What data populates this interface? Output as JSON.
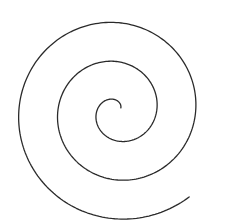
{
  "diagram": {
    "type": "archimedean-spiral",
    "background_color": "#ffffff",
    "stroke_color": "#2a2a2a",
    "stroke_width": 1.3,
    "center": [
      117,
      111
    ],
    "start_angle_deg": -40,
    "turns": 2.75,
    "inner_radius": 5,
    "growth_per_turn": 39,
    "direction": "counterclockwise-outward"
  }
}
